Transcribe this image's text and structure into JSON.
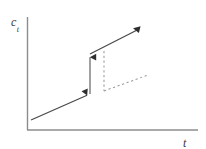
{
  "figure": {
    "background_color": "#ffffff",
    "axis_color": "#8c8c8c",
    "curve_color": "#4a4a4a",
    "dashed_color": "#9a9a9a",
    "label_color": "#3a3a3a",
    "ylabel_var": "c",
    "ylabel_sub": "t",
    "xlabel_var": "t",
    "xlabel_sub": ""
  },
  "chart_data": {
    "type": "line",
    "title": "",
    "xlabel": "t",
    "ylabel": "c_t",
    "grid": false,
    "legend": "none",
    "axes": {
      "x_axis": {
        "x1": 27,
        "y1": 130,
        "x2": 198,
        "y2": 130
      },
      "y_axis": {
        "x1": 27,
        "y1": 17,
        "x2": 27,
        "y2": 130
      }
    },
    "series": [
      {
        "name": "pre-jump-consumption-path",
        "style": "solid",
        "arrow_end": "down-triangle",
        "points": [
          [
            31,
            120
          ],
          [
            90,
            94
          ]
        ]
      },
      {
        "name": "upward-jump",
        "style": "solid",
        "arrow_end": "up-triangle",
        "points": [
          [
            90,
            94
          ],
          [
            90,
            54
          ]
        ]
      },
      {
        "name": "post-jump-consumption-path",
        "style": "solid",
        "arrow_end": "down-triangle",
        "points": [
          [
            90,
            54
          ],
          [
            141,
            28
          ]
        ]
      },
      {
        "name": "counterfactual-drop",
        "style": "dashed",
        "arrow_end": "none",
        "points": [
          [
            104,
            51
          ],
          [
            104,
            91
          ]
        ]
      },
      {
        "name": "counterfactual-path",
        "style": "dashed",
        "arrow_end": "none",
        "points": [
          [
            104,
            91
          ],
          [
            148,
            75
          ]
        ]
      }
    ]
  }
}
